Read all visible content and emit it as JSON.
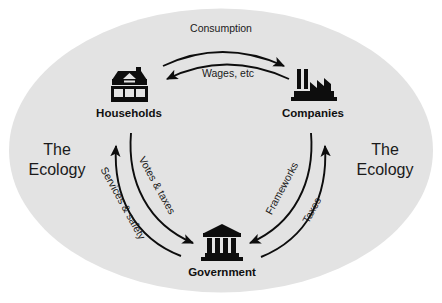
{
  "diagram": {
    "background_color": "#ffffff",
    "ellipse_color": "#e3e3e3",
    "ink_color": "#0d0d0d",
    "nodes": [
      {
        "id": "households",
        "label": "Households",
        "icon": "house-icon",
        "x": 128,
        "y": 118
      },
      {
        "id": "companies",
        "label": "Companies",
        "icon": "factory-icon",
        "x": 313,
        "y": 118
      },
      {
        "id": "government",
        "label": "Government",
        "icon": "government-building-icon",
        "x": 222,
        "y": 267
      }
    ],
    "ecology": {
      "line1": "The",
      "line2": "Ecology",
      "left_x": 57,
      "right_x": 385
    },
    "flows": [
      {
        "id": "consumption",
        "label": "Consumption",
        "from": "households",
        "to": "companies",
        "direction": "right"
      },
      {
        "id": "wages",
        "label": "Wages, etc",
        "from": "companies",
        "to": "households",
        "direction": "left"
      },
      {
        "id": "votes-taxes",
        "label": "Votes & taxes",
        "from": "households",
        "to": "government",
        "direction": "down-right"
      },
      {
        "id": "services-safety",
        "label": "Services & safety",
        "from": "government",
        "to": "households",
        "direction": "up-left"
      },
      {
        "id": "taxes",
        "label": "Taxes",
        "from": "government",
        "to": "companies",
        "direction": "up-right"
      },
      {
        "id": "frameworks",
        "label": "Frameworks",
        "from": "companies",
        "to": "government",
        "direction": "down-left"
      }
    ]
  }
}
